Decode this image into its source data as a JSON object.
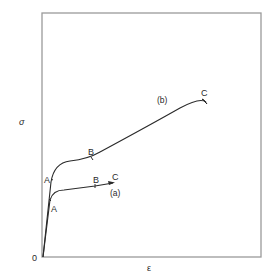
{
  "diagram": {
    "type": "stress-strain curves",
    "colors": {
      "frame": "#9a9a9a",
      "curve": "#2a2a2a",
      "text": "#2a2a2a",
      "background": "#ffffff"
    },
    "axes": {
      "y_label": "σ",
      "x_label": "ε",
      "origin_label": "0"
    },
    "curves": [
      {
        "name": "(a)",
        "points": {
          "A": "A",
          "B": "B",
          "C": "C"
        }
      },
      {
        "name": "(b)",
        "points": {
          "A": "A",
          "B": "B",
          "C": "C"
        }
      }
    ]
  }
}
